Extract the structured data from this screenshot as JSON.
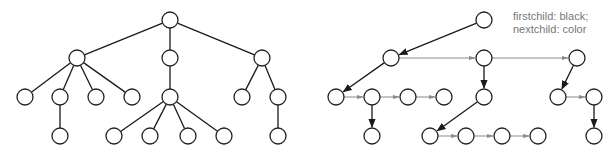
{
  "legend": {
    "line1": "firstchild: black;",
    "line2": "nextchild: color"
  },
  "colors": {
    "firstchild_edge": "#1a1a1a",
    "nextchild_edge": "#8a8a8a",
    "node_stroke": "#222222",
    "node_fill": "#ffffff",
    "legend_text": "#777777"
  },
  "left_tree": {
    "title": "",
    "nodes": [
      {
        "id": "r",
        "x": 170,
        "y": 20
      },
      {
        "id": "a",
        "x": 77,
        "y": 58
      },
      {
        "id": "b",
        "x": 170,
        "y": 58
      },
      {
        "id": "c",
        "x": 262,
        "y": 58
      },
      {
        "id": "a1",
        "x": 25,
        "y": 97
      },
      {
        "id": "a2",
        "x": 60,
        "y": 97
      },
      {
        "id": "a3",
        "x": 96,
        "y": 97
      },
      {
        "id": "a4",
        "x": 132,
        "y": 97
      },
      {
        "id": "b1",
        "x": 170,
        "y": 97
      },
      {
        "id": "c1",
        "x": 242,
        "y": 97
      },
      {
        "id": "c2",
        "x": 278,
        "y": 97
      },
      {
        "id": "a2a",
        "x": 60,
        "y": 136
      },
      {
        "id": "b1a",
        "x": 114,
        "y": 136
      },
      {
        "id": "b1b",
        "x": 150,
        "y": 136
      },
      {
        "id": "b1c",
        "x": 188,
        "y": 136
      },
      {
        "id": "b1d",
        "x": 224,
        "y": 136
      },
      {
        "id": "c2a",
        "x": 278,
        "y": 136
      }
    ],
    "edges": [
      [
        "r",
        "a"
      ],
      [
        "r",
        "b"
      ],
      [
        "r",
        "c"
      ],
      [
        "a",
        "a1"
      ],
      [
        "a",
        "a2"
      ],
      [
        "a",
        "a3"
      ],
      [
        "a",
        "a4"
      ],
      [
        "b",
        "b1"
      ],
      [
        "c",
        "c1"
      ],
      [
        "c",
        "c2"
      ],
      [
        "a2",
        "a2a"
      ],
      [
        "b1",
        "b1a"
      ],
      [
        "b1",
        "b1b"
      ],
      [
        "b1",
        "b1c"
      ],
      [
        "b1",
        "b1d"
      ],
      [
        "c2",
        "c2a"
      ]
    ]
  },
  "right_tree": {
    "nodes": [
      {
        "id": "r",
        "x": 484,
        "y": 20
      },
      {
        "id": "a",
        "x": 391,
        "y": 58
      },
      {
        "id": "b",
        "x": 484,
        "y": 58
      },
      {
        "id": "c",
        "x": 577,
        "y": 58
      },
      {
        "id": "a1",
        "x": 336,
        "y": 97
      },
      {
        "id": "a2",
        "x": 372,
        "y": 97
      },
      {
        "id": "a3",
        "x": 408,
        "y": 97
      },
      {
        "id": "a4",
        "x": 444,
        "y": 97
      },
      {
        "id": "b1",
        "x": 484,
        "y": 97
      },
      {
        "id": "c1",
        "x": 558,
        "y": 97
      },
      {
        "id": "c2",
        "x": 594,
        "y": 97
      },
      {
        "id": "a2a",
        "x": 372,
        "y": 136
      },
      {
        "id": "b1a",
        "x": 430,
        "y": 136
      },
      {
        "id": "b1b",
        "x": 466,
        "y": 136
      },
      {
        "id": "b1c",
        "x": 502,
        "y": 136
      },
      {
        "id": "b1d",
        "x": 538,
        "y": 136
      },
      {
        "id": "c2a",
        "x": 594,
        "y": 136
      }
    ],
    "firstchild_edges": [
      [
        "r",
        "a"
      ],
      [
        "a",
        "a1"
      ],
      [
        "a2",
        "a2a"
      ],
      [
        "b",
        "b1"
      ],
      [
        "b1",
        "b1a"
      ],
      [
        "c",
        "c1"
      ],
      [
        "c2",
        "c2a"
      ]
    ],
    "nextchild_edges": [
      [
        "a",
        "b"
      ],
      [
        "b",
        "c"
      ],
      [
        "a1",
        "a2"
      ],
      [
        "a2",
        "a3"
      ],
      [
        "a3",
        "a4"
      ],
      [
        "c1",
        "c2"
      ],
      [
        "b1a",
        "b1b"
      ],
      [
        "b1b",
        "b1c"
      ],
      [
        "b1c",
        "b1d"
      ]
    ]
  },
  "node_radius": 8
}
